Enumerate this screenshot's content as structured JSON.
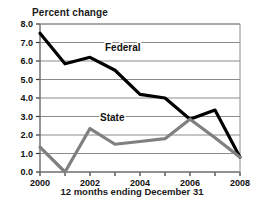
{
  "chart_data": {
    "type": "line",
    "title": "Percent change",
    "xlabel": "12 months ending December 31",
    "ylabel": "",
    "x": [
      2000,
      2001,
      2002,
      2003,
      2004,
      2005,
      2006,
      2007,
      2008
    ],
    "xlim": [
      2000,
      2008
    ],
    "ylim": [
      0.0,
      8.0
    ],
    "grid": true,
    "legend_position": "inline-annotations",
    "xtick_labels": [
      "2000",
      "2002",
      "2004",
      "2006",
      "2008"
    ],
    "xtick_values": [
      2000,
      2002,
      2004,
      2006,
      2008
    ],
    "ytick_labels": [
      "0.0",
      "1.0",
      "2.0",
      "3.0",
      "4.0",
      "5.0",
      "6.0",
      "7.0",
      "8.0"
    ],
    "ytick_values": [
      0.0,
      1.0,
      2.0,
      3.0,
      4.0,
      5.0,
      6.0,
      7.0,
      8.0
    ],
    "series": [
      {
        "name": "Federal",
        "color": "#000000",
        "values": [
          7.5,
          5.85,
          6.2,
          5.5,
          4.2,
          4.0,
          2.85,
          3.35,
          0.8
        ],
        "label_x": 2002.6,
        "label_y": 6.55
      },
      {
        "name": "State",
        "color": "#808080",
        "values": [
          1.35,
          0.0,
          2.35,
          1.5,
          1.65,
          1.8,
          2.85,
          1.85,
          0.8
        ],
        "label_x": 2002.4,
        "label_y": 2.75
      }
    ]
  }
}
